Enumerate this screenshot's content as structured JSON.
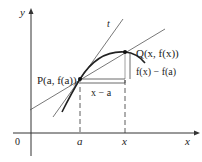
{
  "diagram": {
    "axis_y_label": "y",
    "axis_x_label": "x",
    "origin_label": "0",
    "tangent_label": "t",
    "point_p_label": "P(a, f(a))",
    "point_q_label": "Q(x, f(x))",
    "dx_label": "x − a",
    "dy_label": "f(x) − f(a)",
    "tick_a": "a",
    "tick_x": "x"
  }
}
